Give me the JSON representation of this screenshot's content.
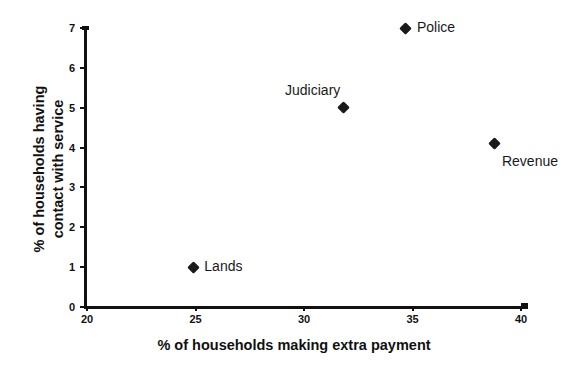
{
  "chart_data": {
    "type": "scatter",
    "title": "",
    "xlabel": "% of households making extra payment",
    "ylabel_line1": "% of households having",
    "ylabel_line2": "contact with service",
    "ylabel": "% of households having contact with service",
    "xlim": [
      20,
      40
    ],
    "ylim": [
      0,
      7
    ],
    "xticks": [
      20,
      25,
      30,
      35,
      40
    ],
    "yticks": [
      0,
      1,
      2,
      3,
      4,
      5,
      6,
      7
    ],
    "xtick_labels": [
      "20",
      "25",
      "30",
      "35",
      "40"
    ],
    "ytick_labels": [
      "0",
      "1",
      "2",
      "3",
      "4",
      "5",
      "6",
      "7"
    ],
    "grid": false,
    "legend": "none",
    "marker": "diamond",
    "marker_color": "#1a1a1a",
    "points": [
      {
        "label": "Lands",
        "x": 24.9,
        "y": 1.0,
        "label_position": "right"
      },
      {
        "label": "Judiciary",
        "x": 31.8,
        "y": 5.0,
        "label_position": "above-left"
      },
      {
        "label": "Police",
        "x": 34.7,
        "y": 7.0,
        "label_position": "right"
      },
      {
        "label": "Revenue",
        "x": 38.8,
        "y": 4.1,
        "label_position": "below-right"
      }
    ]
  }
}
